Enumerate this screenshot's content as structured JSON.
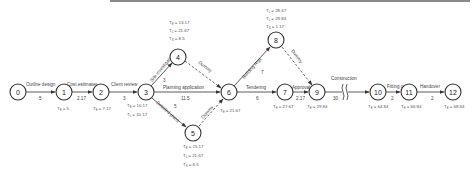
{
  "diagram": {
    "type": "activity-on-arrow network",
    "nodes": [
      {
        "id": "0",
        "label": "0"
      },
      {
        "id": "1",
        "label": "1",
        "times": [
          "T E = 5"
        ]
      },
      {
        "id": "2",
        "label": "2",
        "times": [
          "T E = 7.17"
        ]
      },
      {
        "id": "3",
        "label": "3",
        "times": [
          "T E = 10.17",
          "T L = 10.17"
        ]
      },
      {
        "id": "4",
        "label": "4",
        "times": [
          "T E = 13.17",
          "T L = 21.67",
          "T S = 8.5"
        ]
      },
      {
        "id": "5",
        "label": "5",
        "times": [
          "T E = 15.17",
          "T L = 21.67",
          "T S = 6.5"
        ]
      },
      {
        "id": "6",
        "label": "6",
        "times": [
          "T E = 21.67"
        ]
      },
      {
        "id": "7",
        "label": "7",
        "times": [
          "T E = 27.67"
        ]
      },
      {
        "id": "8",
        "label": "8",
        "times": [
          "T E = 28.67",
          "T L = 29.84",
          "T S = 1.17"
        ]
      },
      {
        "id": "9",
        "label": "9",
        "times": [
          "T E = 29.84"
        ]
      },
      {
        "id": "10",
        "label": "10",
        "times": [
          "T E = 64.84"
        ]
      },
      {
        "id": "11",
        "label": "11",
        "times": [
          "T E = 66.84"
        ]
      },
      {
        "id": "12",
        "label": "12",
        "times": [
          "T E = 68.84"
        ]
      }
    ],
    "edges": [
      {
        "from": "0",
        "to": "1",
        "activity": "Outline design",
        "duration": "5"
      },
      {
        "from": "1",
        "to": "2",
        "activity": "Cost estimates",
        "duration": "2.17"
      },
      {
        "from": "2",
        "to": "3",
        "activity": "Client review",
        "duration": "3"
      },
      {
        "from": "3",
        "to": "4",
        "activity": "Site investigation",
        "duration": "3"
      },
      {
        "from": "3",
        "to": "6",
        "activity": "Planning application",
        "duration": "11.5"
      },
      {
        "from": "3",
        "to": "5",
        "activity": "Detailed plans",
        "duration": "5"
      },
      {
        "from": "4",
        "to": "6",
        "activity": "Dummy",
        "duration": "",
        "dashed": true
      },
      {
        "from": "5",
        "to": "6",
        "activity": "Dummy",
        "duration": "",
        "dashed": true
      },
      {
        "from": "6",
        "to": "8",
        "activity": "Building regs",
        "duration": "7"
      },
      {
        "from": "6",
        "to": "7",
        "activity": "Tendering",
        "duration": "6"
      },
      {
        "from": "8",
        "to": "9",
        "activity": "Dummy",
        "duration": "",
        "dashed": true
      },
      {
        "from": "7",
        "to": "9",
        "activity": "Approval",
        "duration": "2.17"
      },
      {
        "from": "9",
        "to": "10",
        "activity": "Construction",
        "duration": "30",
        "break": true
      },
      {
        "from": "10",
        "to": "11",
        "activity": "Fitting out",
        "duration": "2"
      },
      {
        "from": "11",
        "to": "12",
        "activity": "Handover",
        "duration": "2"
      }
    ]
  },
  "labels": {
    "e01": "Outline design",
    "d01": "5",
    "e12": "Cost estimates",
    "d12": "2.17",
    "e23": "Client review",
    "d23": "3",
    "e34": "Site investigation",
    "d34": "3",
    "e36": "Planning application",
    "d36": "11.5",
    "e35": "Detailed plans",
    "d35": "5",
    "e46": "Dummy",
    "e56": "Dummy",
    "e68": "Building regs",
    "d68": "7",
    "e67": "Tendering",
    "d67": "6",
    "e89": "Dummy",
    "e79": "Approval",
    "d79": "2.17",
    "e910": "Construction",
    "d910": "30",
    "e1011": "Fitting out",
    "d1011": "2",
    "e1112": "Handover",
    "d1112": "2"
  },
  "times": {
    "n1": "= 5",
    "n2": "= 7.17",
    "n3a": "= 10.17",
    "n3b": "= 10.17",
    "n4a": "= 13.17",
    "n4b": "= 21.67",
    "n4c": "= 8.5",
    "n5a": "= 15.17",
    "n5b": "= 21.67",
    "n5c": "= 6.5",
    "n6": "= 21.67",
    "n7": "= 27.67",
    "n8a": "= 28.67",
    "n8b": "= 29.84",
    "n8c": "= 1.17",
    "n9": "= 29.84",
    "n10": "= 64.84",
    "n11": "= 66.84",
    "n12": "= 68.84"
  },
  "nodes": {
    "n0": "0",
    "n1": "1",
    "n2": "2",
    "n3": "3",
    "n4": "4",
    "n5": "5",
    "n6": "6",
    "n7": "7",
    "n8": "8",
    "n9": "9",
    "n10": "10",
    "n11": "11",
    "n12": "12"
  },
  "colors": {
    "line": "#333333",
    "text": "#444444",
    "topbar": "#8a8a8a"
  }
}
